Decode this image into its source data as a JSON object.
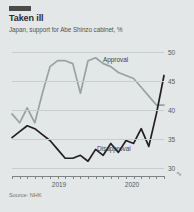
{
  "header": {
    "tag_color": "#4a4a4a",
    "title": "Taken ill",
    "subtitle": "Japan, support for Abe Shinzo cabinet, %"
  },
  "footer": {
    "source": "Source: NHK"
  },
  "series_labels": {
    "approval": "Approval",
    "disapproval": "Disapproval"
  },
  "colors": {
    "approval": "#9aa1a2",
    "disapproval": "#231f20",
    "grid": "#c9cdcd",
    "panel": "#e4e7e7",
    "axis": "#7d8384"
  },
  "axis": {
    "y_ticks": [
      "50",
      "45",
      "40",
      "35",
      "30"
    ],
    "x_labels": [
      "2019",
      "2020"
    ]
  },
  "chart_data": {
    "type": "line",
    "title": "Taken ill",
    "subtitle": "Japan, support for Abe Shinzo cabinet, %",
    "xlabel": "",
    "ylabel": "%",
    "ylim": [
      28,
      51
    ],
    "y_ticks": [
      30,
      35,
      40,
      45,
      50
    ],
    "grid": true,
    "legend": "inline-labels",
    "source": "Source: NHK",
    "x": [
      "2018-10",
      "2018-11",
      "2018-12",
      "2019-01",
      "2019-02",
      "2019-03",
      "2019-04",
      "2019-05",
      "2019-06",
      "2019-07",
      "2019-08",
      "2019-09",
      "2019-10",
      "2019-11",
      "2019-12",
      "2020-01",
      "2020-02",
      "2020-03",
      "2020-04",
      "2020-05",
      "2020-06"
    ],
    "x_tick_labels": {
      "2019-01": "2019",
      "2020-01": "2020"
    },
    "series": [
      {
        "name": "Approval",
        "color": "#9aa1a2",
        "values": [
          38.5,
          37.0,
          39.5,
          37.0,
          42.0,
          46.5,
          47.5,
          47.5,
          47.0,
          42.0,
          47.5,
          48.0,
          47.0,
          46.5,
          45.5,
          45.0,
          44.5,
          43.0,
          41.5,
          40.0,
          40.0
        ]
      },
      {
        "name": "Disapproval",
        "color": "#231f20",
        "values": [
          34.5,
          35.5,
          36.5,
          36.0,
          35.0,
          34.0,
          32.5,
          31.0,
          31.0,
          31.5,
          30.5,
          32.5,
          31.5,
          33.5,
          32.0,
          34.0,
          33.5,
          36.0,
          33.0,
          38.5,
          45.0
        ]
      }
    ],
    "annotations": [
      {
        "text": "Approval",
        "x": "2019-09",
        "y": 49.5
      },
      {
        "text": "Disapproval",
        "x": "2019-11",
        "y": 29.5
      }
    ]
  }
}
